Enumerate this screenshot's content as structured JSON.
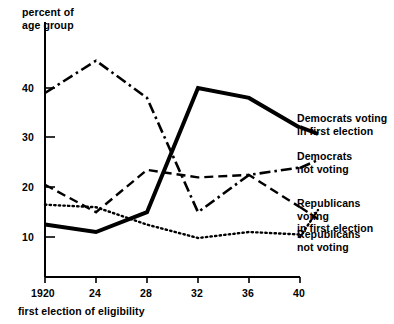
{
  "chart_data": {
    "type": "line",
    "title": "",
    "ylabel": "percent of\nage group",
    "xlabel": "first election of eligibility",
    "x": [
      1920,
      24,
      28,
      32,
      36,
      40
    ],
    "xtick_labels": [
      "1920",
      "24",
      "28",
      "32",
      "36",
      "40"
    ],
    "ytick_labels": [
      "10",
      "20",
      "30",
      "40"
    ],
    "ytick_values": [
      10,
      20,
      30,
      40
    ],
    "ylim": [
      0,
      48
    ],
    "xlim": [
      1920,
      1941
    ],
    "grid": false,
    "legend_position": "right-inline",
    "series": [
      {
        "name": "Democrats voting in first election",
        "label": "Democrats voting\nin first election",
        "style": "solid",
        "color": "#000000",
        "values": [
          12.5,
          11,
          15,
          40,
          38,
          32
        ]
      },
      {
        "name": "Democrats not voting",
        "label": "Democrats\nnot voting",
        "style": "dash-dot",
        "color": "#000000",
        "values": [
          39,
          45.5,
          38,
          15,
          22.5,
          24
        ]
      },
      {
        "name": "Republicans voting in first election",
        "label": "Republicans voting\nin first election",
        "style": "dashed",
        "color": "#000000",
        "values": [
          20.5,
          15,
          23.5,
          22,
          22.5,
          16
        ]
      },
      {
        "name": "Republicans not voting",
        "label": "Republicans\nnot voting",
        "style": "dotted",
        "color": "#000000",
        "values": [
          16.5,
          16,
          12.5,
          9.8,
          11,
          10.5
        ]
      }
    ]
  },
  "axes": {
    "y_title": "percent of\nage group",
    "x_title": "first election of eligibility"
  }
}
